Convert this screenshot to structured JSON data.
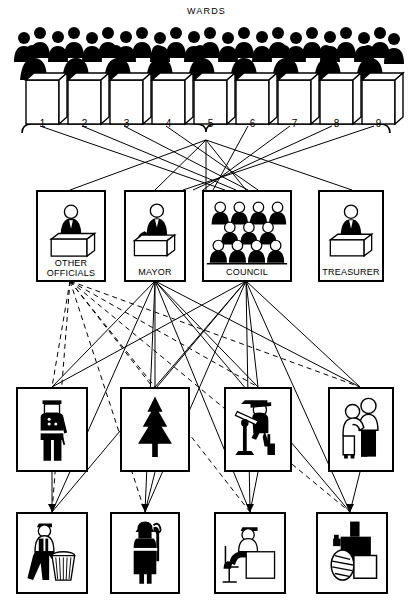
{
  "diagram": {
    "kind": "municipal-government-organization-chart",
    "title": "WARDS",
    "accent_color": "#000000",
    "background_color": "#ffffff"
  },
  "electorate": {
    "title": "WARDS",
    "caption_icon": "voters-at-ballot-box-icon",
    "ward_count": 9,
    "wards": [
      {
        "number": "1",
        "icon": "ballot-box-icon"
      },
      {
        "number": "2",
        "icon": "ballot-box-icon"
      },
      {
        "number": "3",
        "icon": "ballot-box-icon"
      },
      {
        "number": "4",
        "icon": "ballot-box-icon"
      },
      {
        "number": "5",
        "icon": "ballot-box-icon"
      },
      {
        "number": "6",
        "icon": "ballot-box-icon"
      },
      {
        "number": "7",
        "icon": "ballot-box-icon"
      },
      {
        "number": "8",
        "icon": "ballot-box-icon"
      },
      {
        "number": "9",
        "icon": "ballot-box-icon"
      }
    ]
  },
  "elected_officials": {
    "items": [
      {
        "id": "other-officials",
        "label_line1": "OTHER",
        "label_line2": "OFFICIALS",
        "icon": "official-at-desk-icon"
      },
      {
        "id": "mayor",
        "label_line1": "MAYOR",
        "label_line2": "",
        "icon": "mayor-at-desk-icon"
      },
      {
        "id": "council",
        "label_line1": "COUNCIL",
        "label_line2": "",
        "icon": "council-members-icon"
      },
      {
        "id": "treasurer",
        "label_line1": "TREASURER",
        "label_line2": "",
        "icon": "treasurer-at-desk-icon"
      }
    ]
  },
  "departments_upper": {
    "items": [
      {
        "id": "police",
        "icon": "police-officer-icon"
      },
      {
        "id": "parks",
        "icon": "evergreen-tree-icon"
      },
      {
        "id": "engineering",
        "icon": "surveyor-with-transit-icon"
      },
      {
        "id": "health",
        "icon": "doctor-examining-patient-icon"
      }
    ]
  },
  "departments_lower": {
    "items": [
      {
        "id": "sanitation",
        "icon": "worker-with-trash-can-icon"
      },
      {
        "id": "fire",
        "icon": "firefighter-icon"
      },
      {
        "id": "clerical",
        "icon": "office-worker-at-desk-icon"
      },
      {
        "id": "public-works",
        "icon": "steamroller-icon"
      }
    ]
  },
  "legend": {
    "solid_line_meaning": "direct line of authority",
    "dashed_line_meaning": "indirect / advisory relationship"
  }
}
